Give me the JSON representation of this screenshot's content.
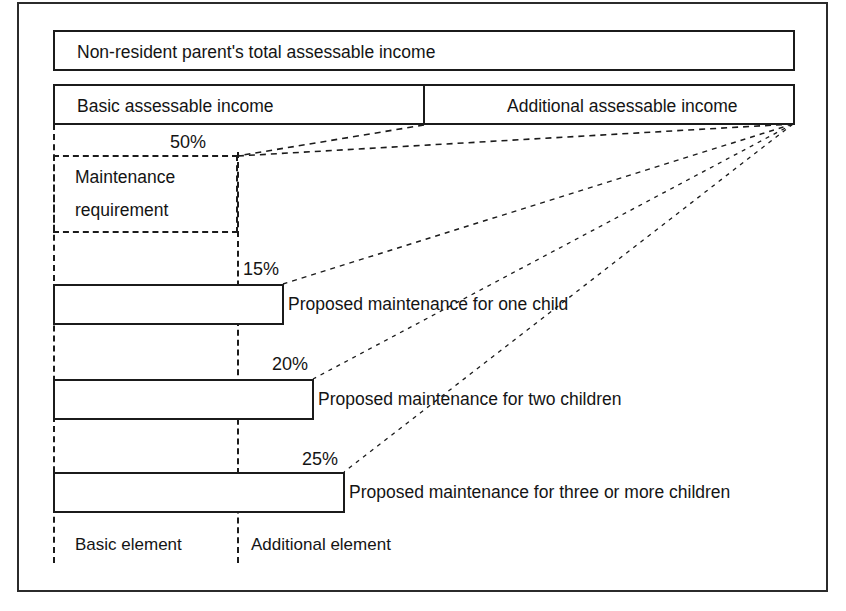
{
  "diagram": {
    "title_box": {
      "label": "Non-resident parent's total assessable income"
    },
    "income_split": [
      {
        "label": "Basic assessable income"
      },
      {
        "label": "Additional assessable income"
      }
    ],
    "maintenance_requirement": {
      "line1": "Maintenance",
      "line2": "requirement"
    },
    "percentages": {
      "maintenance_requirement": "50%",
      "one_child": "15%",
      "two_children": "20%",
      "three_or_more": "25%"
    },
    "bars": [
      {
        "percent": "15%",
        "caption": "Proposed maintenance for one child"
      },
      {
        "percent": "20%",
        "caption": "Proposed maintenance for two children"
      },
      {
        "percent": "25%",
        "caption": "Proposed maintenance for three or more children"
      }
    ],
    "legend": [
      {
        "label": "Basic element"
      },
      {
        "label": "Additional element"
      }
    ],
    "colors": {
      "stroke": "#1b1b1b",
      "frame": "#2b2b2b",
      "background": "#ffffff",
      "text": "#141414"
    }
  }
}
